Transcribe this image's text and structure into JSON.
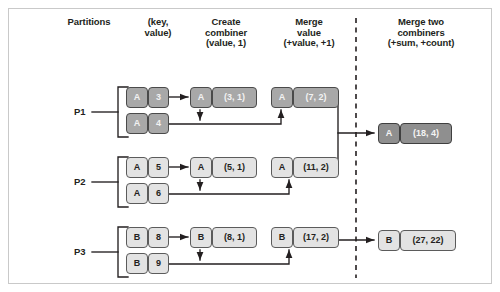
{
  "diagram": {
    "colors": {
      "frame_border": "#c9c9c9",
      "cell_border": "#5b5b5b",
      "cell_light": "#e3e3e3",
      "cell_dark": "#a8a8a8",
      "cell_darker": "#8f8f8f",
      "wire": "#231f20",
      "divider": "#231f20"
    }
  },
  "headers": {
    "partitions": "Partitions",
    "key_value": "(key,\nvalue)",
    "create_combiner": "Create\ncombiner\n(value, 1)",
    "merge_value": "Merge\nvalue\n(+value, +1)",
    "merge_two_combiners": "Merge two\ncombiners\n(+sum, +count)"
  },
  "partitions": [
    {
      "label": "P1",
      "shade": "dark",
      "pairs": [
        {
          "key": "A",
          "value": "3"
        },
        {
          "key": "A",
          "value": "4"
        }
      ],
      "create_combiner": {
        "key": "A",
        "value": "(3, 1)"
      },
      "merge_value": {
        "key": "A",
        "value": "(7, 2)"
      }
    },
    {
      "label": "P2",
      "shade": "light",
      "pairs": [
        {
          "key": "A",
          "value": "5"
        },
        {
          "key": "A",
          "value": "6"
        }
      ],
      "create_combiner": {
        "key": "A",
        "value": "(5, 1)"
      },
      "merge_value": {
        "key": "A",
        "value": "(11, 2)"
      }
    },
    {
      "label": "P3",
      "shade": "light",
      "pairs": [
        {
          "key": "B",
          "value": "8"
        },
        {
          "key": "B",
          "value": "9"
        }
      ],
      "create_combiner": {
        "key": "B",
        "value": "(8, 1)"
      },
      "merge_value": {
        "key": "B",
        "value": "(17, 2)"
      }
    }
  ],
  "results": [
    {
      "key": "A",
      "value": "(18, 4)",
      "shade": "darker"
    },
    {
      "key": "B",
      "value": "(27, 22)",
      "shade": "light"
    }
  ]
}
